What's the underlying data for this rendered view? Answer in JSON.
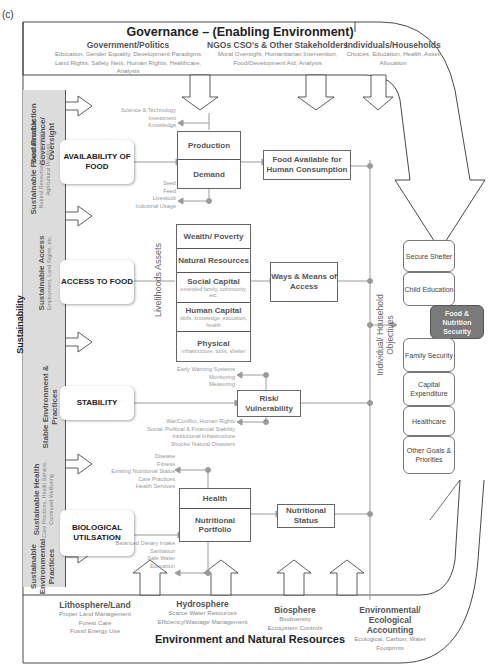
{
  "panel_label": "(c)",
  "governance": {
    "title": "Governance – (Enabling Environment)",
    "columns": [
      {
        "heading": "Government/Politics",
        "text": "Education, Gender Equality, Development Paradigms\nLand Rights, Safety Nets, Human Rights, Healthcare,\nAnalysis"
      },
      {
        "heading": "NGOs CSO's & Other Stakeholders",
        "text": "Moral Oversight, Humanitarian Intervention,\nFood/Development Aid, Analysis"
      },
      {
        "heading": "Individuals/Households",
        "text": "Choices, Education, Health, Asset\nAllocation"
      }
    ]
  },
  "sustainability": {
    "label": "Sustainability",
    "sections": [
      {
        "title": "Sustainable Governance/ Oversight",
        "subtitle": ""
      },
      {
        "title": "Sustainable Food Production",
        "subtitle": "Natural Resource Management, Agricultural Practices"
      },
      {
        "title": "Sustainable Access",
        "subtitle": "Employment, Land Rights, etc."
      },
      {
        "title": "Stable Environment & Practices",
        "subtitle": ""
      },
      {
        "title": "Sustainable Health",
        "subtitle": "Care Practices, Health Service, Continued Wellbeing"
      },
      {
        "title": "Sustainable Environmental Practices",
        "subtitle": ""
      }
    ]
  },
  "pillars": {
    "availability": "AVAILABILITY OF FOOD",
    "access": "ACCESS TO FOOD",
    "stability": "STABILITY",
    "utilisation": "BIOLOGICAL UTILSATION"
  },
  "availability": {
    "notes_top": "Science & Technology\nInvestment\nKnowledge",
    "notes_bottom": "Seed\nFeed\nLivestock\nIndustrial Usage",
    "box_top": "Production",
    "box_bottom": "Demand",
    "result": "Food Available for Human Consumption"
  },
  "access": {
    "side_label": "Livelihoods Assets",
    "assets": [
      {
        "title": "Wealth/ Poverty",
        "sub": ""
      },
      {
        "title": "Natural Resources",
        "sub": ""
      },
      {
        "title": "Social Capital",
        "sub": "extended family, community, etc."
      },
      {
        "title": "Human Capital",
        "sub": "skills, knowledge, education, health"
      },
      {
        "title": "Physical",
        "sub": "infrastructure, tools, shelter"
      }
    ],
    "result": "Ways & Means of Access"
  },
  "stability": {
    "notes_top": "Early Warning Systems\nMonitoring\nMeasuring",
    "notes_bottom": "War/Conflict, Human Rights\nSocial, Political & Financial Stability\nInstitutional Infrastructure\nShocks/ Natural Disasters",
    "box": "Risk/ Vulnerability"
  },
  "utilisation": {
    "notes_top": "Disease\nFitness\nExisting Nutritional Status\nCare Practices\nHealth Services",
    "notes_bottom": "Balanced Dietary Intake\nSanitation\nSafe Water\nEducation",
    "box_top": "Health",
    "box_bottom": "Nutritional Portfolio",
    "result": "Nutritional Status"
  },
  "objectives": {
    "label": "Individual/ Household Objectives",
    "items": [
      {
        "label": "Secure Shelter",
        "highlight": false
      },
      {
        "label": "Child Education",
        "highlight": false
      },
      {
        "label": "Food & Nutrition Security",
        "highlight": true
      },
      {
        "label": "Family Security",
        "highlight": false
      },
      {
        "label": "Capital Expenditure",
        "highlight": false
      },
      {
        "label": "Healthcare",
        "highlight": false
      },
      {
        "label": "Other Goals & Priorities",
        "highlight": false
      }
    ]
  },
  "environment": {
    "title": "Environment and Natural Resources",
    "columns": [
      {
        "heading": "Lithosphere/Land",
        "text": "Proper Land Management\nForest Care\nFossil Energy Use"
      },
      {
        "heading": "Hydrosphere",
        "text": "Scarce Water Resources\nEfficiency/Wastage Management"
      },
      {
        "heading": "Biosphere",
        "text": "Biodiversity\nEcosystem Controls"
      },
      {
        "heading": "Environmental/ Ecological Accounting",
        "text": "Ecological, Carbon, Water\nFootprints"
      }
    ]
  },
  "colors": {
    "line": "#9a9a9a",
    "strip": "#dcdcdc",
    "highlight": "#7a7a7a"
  }
}
